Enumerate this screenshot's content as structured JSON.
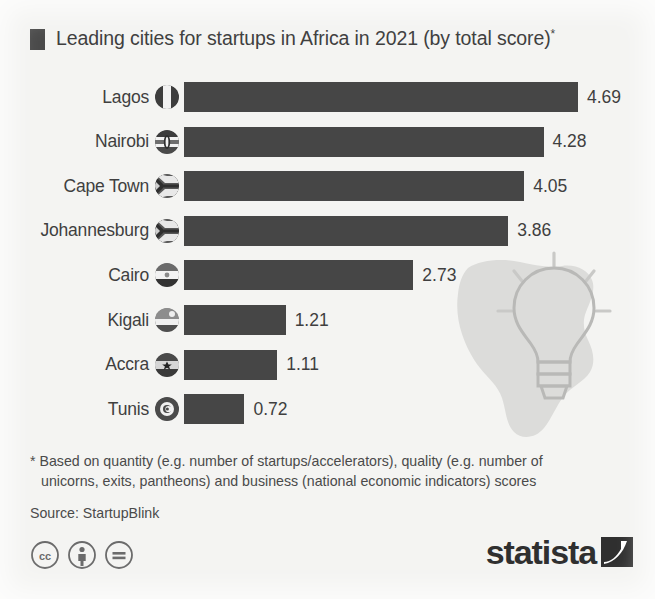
{
  "chart_data": {
    "type": "bar",
    "orientation": "horizontal",
    "title": "Leading cities for startups in Africa in 2021 (by total score)",
    "title_marker": "*",
    "xlabel": "",
    "ylabel": "",
    "xlim": [
      0,
      5
    ],
    "grid": false,
    "legend": "none",
    "bar_color": "#464646",
    "background_color": "#f4f4f2",
    "categories": [
      "Lagos",
      "Nairobi",
      "Cape Town",
      "Johannesburg",
      "Cairo",
      "Kigali",
      "Accra",
      "Tunis"
    ],
    "values": [
      4.69,
      4.28,
      4.05,
      3.86,
      2.73,
      1.21,
      1.11,
      0.72
    ],
    "value_labels": [
      "4.69",
      "4.28",
      "4.05",
      "3.86",
      "2.73",
      "1.21",
      "1.11",
      "0.72"
    ],
    "flags": [
      "nigeria-flag-icon",
      "kenya-flag-icon",
      "south-africa-flag-icon",
      "south-africa-flag-icon",
      "egypt-flag-icon",
      "rwanda-flag-icon",
      "ghana-flag-icon",
      "tunisia-flag-icon"
    ],
    "rows": [
      {
        "city": "Lagos",
        "value": 4.69,
        "label": "4.69",
        "flag": "nigeria-flag-icon"
      },
      {
        "city": "Nairobi",
        "value": 4.28,
        "label": "4.28",
        "flag": "kenya-flag-icon"
      },
      {
        "city": "Cape Town",
        "value": 4.05,
        "label": "4.05",
        "flag": "south-africa-flag-icon"
      },
      {
        "city": "Johannesburg",
        "value": 3.86,
        "label": "3.86",
        "flag": "south-africa-flag-icon"
      },
      {
        "city": "Cairo",
        "value": 2.73,
        "label": "2.73",
        "flag": "egypt-flag-icon"
      },
      {
        "city": "Kigali",
        "value": 1.21,
        "label": "1.21",
        "flag": "rwanda-flag-icon"
      },
      {
        "city": "Accra",
        "value": 1.11,
        "label": "1.11",
        "flag": "ghana-flag-icon"
      },
      {
        "city": "Tunis",
        "value": 0.72,
        "label": "0.72",
        "flag": "tunisia-flag-icon"
      }
    ]
  },
  "footnote": {
    "line1": "* Based on quantity (e.g. number of startups/accelerators), quality (e.g. number of",
    "line2": "unicorns, exits, pantheons) and business (national economic indicators) scores"
  },
  "source": "Source: StartupBlink",
  "footer": {
    "license_icons": [
      "cc-icon",
      "cc-by-person-icon",
      "cc-nd-equals-icon"
    ],
    "brand": "statista",
    "brand_mark": "statista-swoosh-icon"
  }
}
